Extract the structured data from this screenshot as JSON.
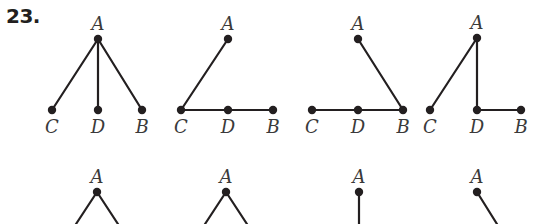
{
  "problem": {
    "number": "23."
  },
  "colors": {
    "ink": "#231f20",
    "label": "#3a3a3a",
    "background": "#ffffff"
  },
  "trees": [
    {
      "id": "tree-1",
      "nodes": [
        {
          "id": "A",
          "label": "A",
          "x": 98,
          "y": 39
        },
        {
          "id": "C",
          "label": "C",
          "x": 52,
          "y": 110
        },
        {
          "id": "D",
          "label": "D",
          "x": 98,
          "y": 110
        },
        {
          "id": "B",
          "label": "B",
          "x": 142,
          "y": 110
        }
      ],
      "edges": [
        [
          "A",
          "C"
        ],
        [
          "A",
          "D"
        ],
        [
          "A",
          "B"
        ]
      ]
    },
    {
      "id": "tree-2",
      "nodes": [
        {
          "id": "A",
          "label": "A",
          "x": 228,
          "y": 39
        },
        {
          "id": "C",
          "label": "C",
          "x": 181,
          "y": 110
        },
        {
          "id": "D",
          "label": "D",
          "x": 228,
          "y": 110
        },
        {
          "id": "B",
          "label": "B",
          "x": 273,
          "y": 110
        }
      ],
      "edges": [
        [
          "A",
          "C"
        ],
        [
          "C",
          "D"
        ],
        [
          "D",
          "B"
        ]
      ]
    },
    {
      "id": "tree-3",
      "nodes": [
        {
          "id": "A",
          "label": "A",
          "x": 358,
          "y": 39
        },
        {
          "id": "C",
          "label": "C",
          "x": 312,
          "y": 110
        },
        {
          "id": "D",
          "label": "D",
          "x": 358,
          "y": 110
        },
        {
          "id": "B",
          "label": "B",
          "x": 403,
          "y": 110
        }
      ],
      "edges": [
        [
          "A",
          "B"
        ],
        [
          "C",
          "D"
        ],
        [
          "D",
          "B"
        ]
      ]
    },
    {
      "id": "tree-4",
      "nodes": [
        {
          "id": "A",
          "label": "A",
          "x": 477,
          "y": 38
        },
        {
          "id": "C",
          "label": "C",
          "x": 430,
          "y": 110
        },
        {
          "id": "D",
          "label": "D",
          "x": 477,
          "y": 110
        },
        {
          "id": "B",
          "label": "B",
          "x": 521,
          "y": 110
        }
      ],
      "edges": [
        [
          "A",
          "C"
        ],
        [
          "A",
          "D"
        ],
        [
          "D",
          "B"
        ]
      ]
    },
    {
      "id": "tree-5",
      "nodes": [
        {
          "id": "A",
          "label": "A",
          "x": 97,
          "y": 192
        }
      ],
      "partial_edges": [
        {
          "from": "A",
          "to_x": 76,
          "to_y": 224
        },
        {
          "from": "A",
          "to_x": 118,
          "to_y": 224
        }
      ]
    },
    {
      "id": "tree-6",
      "nodes": [
        {
          "id": "A",
          "label": "A",
          "x": 226,
          "y": 192
        }
      ],
      "partial_edges": [
        {
          "from": "A",
          "to_x": 205,
          "to_y": 224
        },
        {
          "from": "A",
          "to_x": 247,
          "to_y": 224
        }
      ]
    },
    {
      "id": "tree-7",
      "nodes": [
        {
          "id": "A",
          "label": "A",
          "x": 359,
          "y": 192
        }
      ],
      "partial_edges": [
        {
          "from": "A",
          "to_x": 359,
          "to_y": 224
        }
      ]
    },
    {
      "id": "tree-8",
      "nodes": [
        {
          "id": "A",
          "label": "A",
          "x": 477,
          "y": 192
        }
      ],
      "partial_edges": [
        {
          "from": "A",
          "to_x": 497,
          "to_y": 224
        }
      ]
    }
  ]
}
